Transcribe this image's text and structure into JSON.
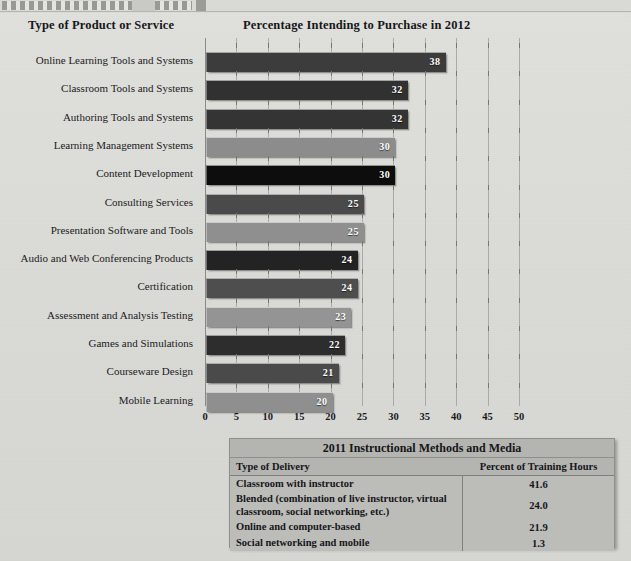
{
  "headings": {
    "category": "Type of Product or Service",
    "value": "Percentage Intending to Purchase in 2012"
  },
  "chart_data": {
    "type": "bar",
    "orientation": "horizontal",
    "title": "Percentage Intending to Purchase in 2012",
    "xlabel": "",
    "ylabel": "Type of Product or Service",
    "xlim": [
      0,
      50
    ],
    "xticks": [
      "0",
      "5",
      "10",
      "15",
      "20",
      "25",
      "30",
      "35",
      "40",
      "45",
      "50"
    ],
    "grid": true,
    "legend": "none",
    "categories": [
      "Online Learning Tools and Systems",
      "Classroom Tools and Systems",
      "Authoring Tools and Systems",
      "Learning Management Systems",
      "Content Development",
      "Consulting Services",
      "Presentation Software and Tools",
      "Audio and Web Conferencing Products",
      "Certification",
      "Assessment and Analysis Testing",
      "Games and Simulations",
      "Courseware Design",
      "Mobile Learning"
    ],
    "values": [
      38,
      32,
      32,
      30,
      30,
      25,
      25,
      24,
      24,
      23,
      22,
      21,
      20
    ],
    "bar_colors": [
      "#3c3c3c",
      "#313131",
      "#343434",
      "#8c8c8c",
      "#0d0d0d",
      "#4a4a4a",
      "#8f8f8f",
      "#232323",
      "#4e4e4e",
      "#949494",
      "#2d2d2d",
      "#4a4a4a",
      "#8f8f8f"
    ]
  },
  "table": {
    "title": "2011 Instructional Methods and Media",
    "columns": [
      "Type of Delivery",
      "Percent of Training Hours"
    ],
    "rows": [
      {
        "delivery": "Classroom with instructor",
        "percent": "41.6"
      },
      {
        "delivery": "Blended (combination of live instructor, virtual classroom, social  networking, etc.)",
        "percent": "24.0"
      },
      {
        "delivery": "Online and computer-based",
        "percent": "21.9"
      },
      {
        "delivery": "Social networking and mobile",
        "percent": "1.3"
      }
    ]
  }
}
